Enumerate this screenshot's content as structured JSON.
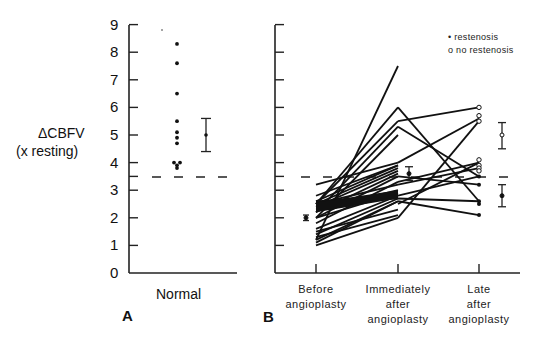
{
  "chart_data": [
    {
      "panel": "A",
      "type": "scatter",
      "ylabel_line1": "ΔCBFV",
      "ylabel_line2": "(x resting)",
      "ylim": [
        0,
        9
      ],
      "yticks": [
        "0",
        "1",
        "2",
        "3",
        "4",
        "5",
        "6",
        "7",
        "8",
        "9"
      ],
      "categories": [
        "Normal"
      ],
      "threshold": 3.5,
      "points": [
        8.3,
        7.6,
        6.5,
        5.5,
        5.1,
        4.9,
        4.7,
        4.0,
        4.0,
        3.9,
        3.8
      ],
      "mean": 5.0,
      "error_bar": [
        4.4,
        5.6
      ],
      "grid": false
    },
    {
      "panel": "B",
      "type": "line",
      "ylim": [
        0,
        9
      ],
      "categories": [
        "Before angioplasty",
        "Immediately after angioplasty",
        "Late after angioplasty"
      ],
      "category_lines": [
        [
          "Before",
          "angioplasty"
        ],
        [
          "Immediately",
          "after",
          "angioplasty"
        ],
        [
          "Late",
          "after",
          "angioplasty"
        ]
      ],
      "threshold": 3.5,
      "legend": [
        {
          "marker": "filled",
          "label": "restenosis"
        },
        {
          "marker": "open",
          "label": "no restenosis"
        }
      ],
      "legend_position": "upper right",
      "series": [
        {
          "name": "before-to-immediate",
          "pairs": [
            [
              1.2,
              7.5
            ],
            [
              2.5,
              6.0
            ],
            [
              2.5,
              5.5
            ],
            [
              2.2,
              5.3
            ],
            [
              2.0,
              5.0
            ],
            [
              3.2,
              4.0
            ],
            [
              2.8,
              3.9
            ],
            [
              2.6,
              3.9
            ],
            [
              2.5,
              3.8
            ],
            [
              2.4,
              3.7
            ],
            [
              2.2,
              3.6
            ],
            [
              2.0,
              3.5
            ],
            [
              1.8,
              3.3
            ],
            [
              2.5,
              3.2
            ],
            [
              2.3,
              3.0
            ],
            [
              2.0,
              2.9
            ],
            [
              1.6,
              2.8
            ],
            [
              1.4,
              2.7
            ],
            [
              1.2,
              2.6
            ],
            [
              1.1,
              2.6
            ],
            [
              2.6,
              2.7
            ],
            [
              1.5,
              2.3
            ],
            [
              1.3,
              2.1
            ],
            [
              1.0,
              2.0
            ]
          ]
        },
        {
          "name": "immediate-to-late",
          "pairs": [
            [
              6.0,
              2.6
            ],
            [
              5.5,
              6.0
            ],
            [
              5.3,
              3.5
            ],
            [
              4.0,
              5.6
            ],
            [
              3.3,
              4.0
            ],
            [
              3.2,
              3.8
            ],
            [
              2.8,
              3.5
            ],
            [
              2.6,
              2.1
            ],
            [
              2.7,
              2.6
            ],
            [
              3.5,
              3.2
            ],
            [
              2.5,
              4.0
            ],
            [
              2.0,
              5.5
            ]
          ]
        }
      ],
      "before_mean": 2.0,
      "before_error": [
        1.9,
        2.1
      ],
      "immediate_mean": 3.6,
      "immediate_error": [
        3.35,
        3.85
      ],
      "late_no_restenosis_mean": 5.0,
      "late_no_restenosis_error": [
        4.5,
        5.45
      ],
      "late_restenosis_mean": 2.8,
      "late_restenosis_error": [
        2.4,
        3.2
      ],
      "late_points_open": [
        6.0,
        5.7,
        5.5,
        4.1,
        3.9,
        3.8,
        3.7
      ],
      "late_points_filled": [
        3.5,
        3.2,
        2.6,
        2.5,
        2.1
      ],
      "grid": false
    }
  ],
  "labels": {
    "panel_a": "A",
    "panel_b": "B",
    "normal": "Normal",
    "legend_restenosis": "• restenosis",
    "legend_no_restenosis": "o no restenosis"
  }
}
